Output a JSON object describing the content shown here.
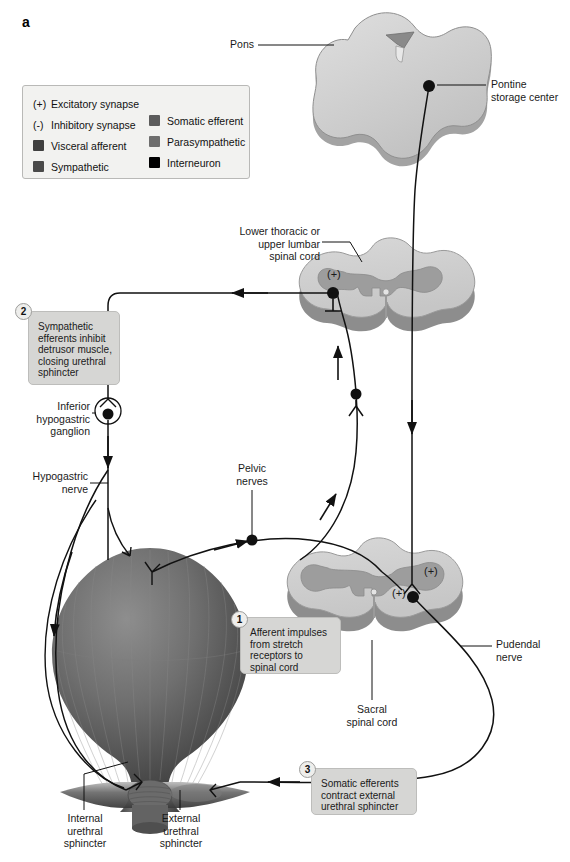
{
  "figure": {
    "panel_letter": "a",
    "title_implied": "Storage reflexes of the urinary bladder"
  },
  "legend": {
    "symbols": [
      {
        "sym": "(+)",
        "label": "Excitatory synapse"
      },
      {
        "sym": "(-)",
        "label": "Inhibitory synapse"
      }
    ],
    "swatches_left": [
      {
        "label": "Visceral afferent",
        "color": "#3f3f3f"
      },
      {
        "label": "Sympathetic",
        "color": "#4a4a4a"
      }
    ],
    "swatches_right": [
      {
        "label": "Somatic efferent",
        "color": "#5c5c5c"
      },
      {
        "label": "Parasympathetic",
        "color": "#6e6e6e"
      },
      {
        "label": "Interneuron",
        "color": "#000000"
      }
    ]
  },
  "labels": {
    "pons": "Pons",
    "pontine_storage_center": "Pontine\nstorage center",
    "lower_thoracic": "Lower thoracic or\nupper lumbar\nspinal cord",
    "inferior_hypogastric_ganglion": "Inferior\nhypogastric\nganglion",
    "hypogastric_nerve": "Hypogastric\nnerve",
    "pelvic_nerves": "Pelvic\nnerves",
    "sacral_spinal_cord": "Sacral\nspinal cord",
    "pudendal_nerve": "Pudendal\nnerve",
    "internal_urethral_sphincter": "Internal\nurethral\nsphincter",
    "external_urethral_sphincter": "External\nurethral\nsphincter"
  },
  "synapse_markers": {
    "thoracic_plus": "(+)",
    "sacral_plus_upper": "(+)",
    "sacral_plus_lower": "(+)"
  },
  "callouts": [
    {
      "number": "1",
      "text": "Afferent impulses\nfrom stretch\nreceptors to\nspinal cord"
    },
    {
      "number": "2",
      "text": "Sympathetic\nefferents inhibit\ndetrusor muscle,\nclosing urethral\nsphincter"
    },
    {
      "number": "3",
      "text": "Somatic efferents\ncontract external\nurethral sphincter"
    }
  ],
  "colors": {
    "background": "#ffffff",
    "white_matter": "#cfcfcf",
    "gray_matter": "#9b9b9b",
    "cord_edge": "#8e8e8e",
    "pons_top": "#d0d0d0",
    "pons_side": "#9a9a9a",
    "bladder_dark": "#5b5b5b",
    "bladder_light": "#a9a9a9",
    "callout_bg": "#d6d6d4",
    "legend_bg": "#f2f2f0",
    "line": "#111111"
  }
}
